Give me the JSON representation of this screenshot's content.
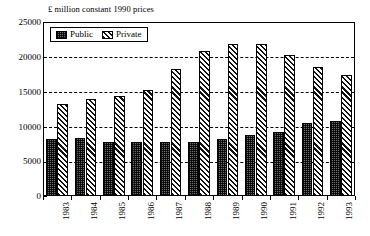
{
  "chart_data": {
    "type": "bar",
    "title": "£ million constant 1990 prices",
    "xlabel": "",
    "ylabel": "£ million constant 1990 prices",
    "categories": [
      "1983",
      "1984",
      "1985",
      "1986",
      "1987",
      "1988",
      "1989",
      "1990",
      "1991",
      "1992",
      "1993"
    ],
    "series": [
      {
        "name": "Public",
        "values": [
          8200,
          8300,
          7800,
          7700,
          7800,
          7800,
          8200,
          8800,
          9200,
          10500,
          10800
        ]
      },
      {
        "name": "Private",
        "values": [
          13200,
          14000,
          14300,
          15300,
          18200,
          20900,
          21900,
          21800,
          20200,
          18500,
          17400
        ]
      }
    ],
    "ylim": [
      0,
      25000
    ],
    "yticks": [
      0,
      5000,
      10000,
      15000,
      20000,
      25000
    ],
    "ytick_labels": [
      "0",
      "5000",
      "10000",
      "15000",
      "20000",
      "25000"
    ],
    "grid": true,
    "grid_style": "dashed-horizontal",
    "legend_position": "top-left-inside",
    "legend": [
      {
        "label": "Public",
        "pattern": "stipple-dots",
        "color": "#6f6f6f"
      },
      {
        "label": "Private",
        "pattern": "diagonal-hatch",
        "color": "#111111"
      }
    ],
    "xlabel_rotation": "vertical"
  },
  "colors": {
    "background": "#ffffff",
    "axis": "#000000",
    "grid": "#000000",
    "public": "#6f6f6f",
    "private": "#111111"
  }
}
